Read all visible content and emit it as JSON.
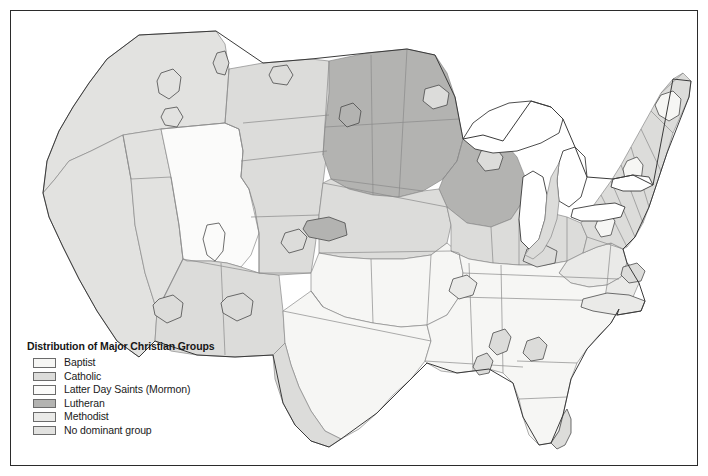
{
  "figure": {
    "kind": "choropleth-map",
    "background_color": "#ffffff",
    "frame_color": "#2b2b2b"
  },
  "legend": {
    "title": "Distribution of Major Christian Groups",
    "items": [
      {
        "label": "Baptist",
        "color": "#f6f6f4",
        "border": "#6b6b6b"
      },
      {
        "label": "Catholic",
        "color": "#dcdcda",
        "border": "#6b6b6b"
      },
      {
        "label": "Latter Day Saints (Mormon)",
        "color": "#fbfbfa",
        "border": "#6b6b6b"
      },
      {
        "label": "Lutheran",
        "color": "#b3b3b1",
        "border": "#6b6b6b"
      },
      {
        "label": "Methodist",
        "color": "#eaeae8",
        "border": "#6b6b6b"
      },
      {
        "label": "No dominant group",
        "color": "#e2e2e0",
        "border": "#6b6b6b"
      }
    ]
  },
  "map": {
    "outline_color": "#3a3a3a",
    "state_border_color": "#8a8a8a",
    "enclave_border_color": "#4a4a4a",
    "regions": [
      {
        "name": "pacific-northwest",
        "group": "No dominant group"
      },
      {
        "name": "california",
        "group": "No dominant group"
      },
      {
        "name": "nevada",
        "group": "No dominant group"
      },
      {
        "name": "utah-idaho-lds-core",
        "group": "Latter Day Saints (Mormon)"
      },
      {
        "name": "arizona-new-mexico",
        "group": "Catholic"
      },
      {
        "name": "montana-wyoming",
        "group": "Catholic"
      },
      {
        "name": "dakotas-minnesota",
        "group": "Lutheran"
      },
      {
        "name": "wisconsin",
        "group": "Lutheran"
      },
      {
        "name": "nebraska-iowa",
        "group": "Catholic"
      },
      {
        "name": "kansas-missouri",
        "group": "Baptist"
      },
      {
        "name": "oklahoma-texas",
        "group": "Baptist"
      },
      {
        "name": "south-texas",
        "group": "Catholic"
      },
      {
        "name": "great-lakes-band",
        "group": "Catholic"
      },
      {
        "name": "ohio-valley",
        "group": "Methodist"
      },
      {
        "name": "southeast",
        "group": "Baptist"
      },
      {
        "name": "florida-south",
        "group": "Catholic"
      },
      {
        "name": "northeast",
        "group": "Catholic"
      },
      {
        "name": "appalachia",
        "group": "Methodist"
      }
    ]
  }
}
